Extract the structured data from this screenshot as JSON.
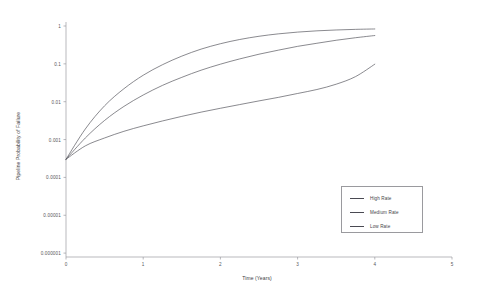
{
  "chart_data": {
    "type": "line",
    "title": "",
    "xlabel": "Time (Years)",
    "ylabel": "Pipeline Probability of Failure",
    "xlim": [
      0,
      5
    ],
    "ylim": [
      1e-06,
      1
    ],
    "yscale": "log",
    "grid": false,
    "legend_position": "lower right",
    "xticks": [
      0,
      1,
      2,
      3,
      4,
      5
    ],
    "xtick_labels": [
      "0",
      "1",
      "2",
      "3",
      "4",
      "5"
    ],
    "yticks": [
      1,
      0.1,
      0.01,
      0.001,
      0.0001,
      1e-05,
      1e-06
    ],
    "ytick_labels": [
      "1",
      "0.1",
      "0.01",
      "0.001",
      "0.0001",
      "0.00001",
      "0.000001"
    ],
    "x": [
      0,
      0.25,
      0.5,
      0.75,
      1,
      1.25,
      1.5,
      1.75,
      2,
      2.25,
      2.5,
      2.75,
      3,
      3.25,
      3.5,
      3.75,
      4
    ],
    "series": [
      {
        "name": "High Rate",
        "color": "#4a4a52",
        "values": [
          0.0003,
          0.0019,
          0.0078,
          0.022,
          0.05,
          0.095,
          0.16,
          0.245,
          0.34,
          0.44,
          0.535,
          0.62,
          0.69,
          0.745,
          0.785,
          0.815,
          0.835
        ]
      },
      {
        "name": "Medium Rate",
        "color": "#4a4a52",
        "values": [
          0.0003,
          0.0011,
          0.0032,
          0.0075,
          0.015,
          0.027,
          0.044,
          0.068,
          0.098,
          0.135,
          0.18,
          0.23,
          0.29,
          0.35,
          0.42,
          0.49,
          0.56
        ]
      },
      {
        "name": "Low Rate",
        "color": "#4a4a52",
        "values": [
          0.0003,
          0.00068,
          0.0011,
          0.00165,
          0.0023,
          0.0031,
          0.0041,
          0.0053,
          0.0067,
          0.0084,
          0.0105,
          0.013,
          0.0165,
          0.021,
          0.029,
          0.046,
          0.098
        ]
      }
    ],
    "legend": [
      {
        "label": "High Rate"
      },
      {
        "label": "Medium Rate"
      },
      {
        "label": "Low Rate"
      }
    ],
    "axis_color": "#8c8c92",
    "background": "#ffffff"
  }
}
